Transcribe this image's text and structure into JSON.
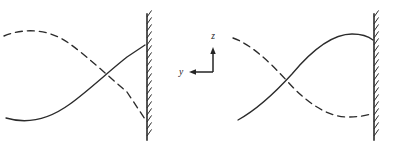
{
  "figure": {
    "background_color": "#ffffff",
    "line_color": "#2b2b2b",
    "width": 396,
    "height": 146
  },
  "axes_indicator": {
    "name": "coordinate-axes",
    "corner": [
      213,
      72
    ],
    "vertical_axis": {
      "label": "z",
      "direction": "up",
      "tip": [
        213,
        47
      ],
      "label_pos": [
        213,
        39
      ]
    },
    "horizontal_axis": {
      "label": "y",
      "direction": "left",
      "tip": [
        189,
        72
      ],
      "label_pos": [
        181,
        75
      ]
    },
    "color": "#242424"
  },
  "panels": [
    {
      "name": "panel-left",
      "wall": {
        "name": "fixed-wall-left",
        "x": 147,
        "y_top": 14,
        "y_bottom": 140,
        "hatch_side": "right",
        "hatch_length": 8,
        "hatch_spacing": 7,
        "hatch_angle_deg": 55
      },
      "curves": [
        {
          "name": "incident-wave-left",
          "style": "solid",
          "path": "M 6,118 C 26,124 48,120 70,104 C 88,91 108,72 127,57 L 145,45",
          "description": "Solid curve: trough at left, rising steeply to the wall top"
        },
        {
          "name": "reflected-wave-left",
          "style": "dashed",
          "dash": "7,5",
          "path": "M 4,36 C 24,28 48,28 70,44 C 88,57 108,76 127,92 L 145,119",
          "description": "Dashed curve: crest at left, falling steeply to the wall bottom"
        }
      ],
      "crossing_point": [
        107,
        75
      ]
    },
    {
      "name": "panel-right",
      "wall": {
        "name": "fixed-wall-right",
        "x": 374,
        "y_top": 14,
        "y_bottom": 140,
        "hatch_side": "right",
        "hatch_length": 8,
        "hatch_spacing": 7,
        "hatch_angle_deg": 55
      },
      "curves": [
        {
          "name": "incident-wave-right",
          "style": "solid",
          "path": "M 238,120 C 256,110 272,96 292,74 C 312,50 332,34 352,34 C 362,34 368,36 373,40",
          "description": "Solid curve: rising from lower left to a broad crest, meeting the wall"
        },
        {
          "name": "reflected-wave-right",
          "style": "dashed",
          "dash": "7,5",
          "path": "M 233,38 C 250,44 268,60 288,82 C 306,102 326,116 346,117 C 358,117 366,116 373,113",
          "description": "Dashed curve: falling from upper left to a broad trough, meeting the wall"
        }
      ],
      "crossing_point": [
        283,
        80
      ]
    }
  ]
}
